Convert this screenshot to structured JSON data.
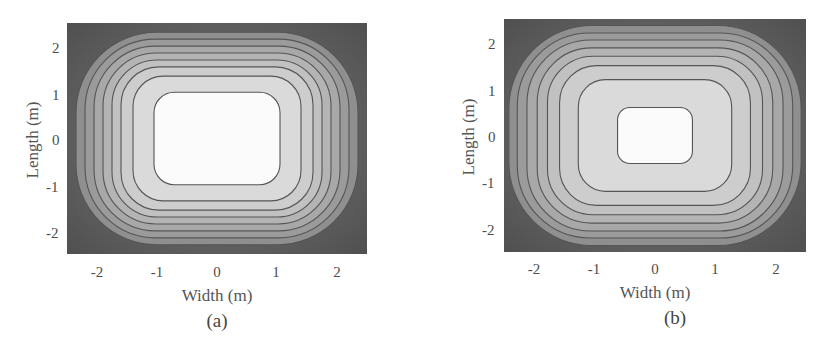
{
  "figure": {
    "panels": [
      {
        "id": "a",
        "caption": "(a)",
        "xlabel": "Width (m)",
        "ylabel": "Length (m)",
        "xticks": [
          "-2",
          "-1",
          "0",
          "1",
          "2"
        ],
        "yticks": [
          "2",
          "1",
          "0",
          "-1",
          "-2"
        ]
      },
      {
        "id": "b",
        "caption": "(b)",
        "xlabel": "Width (m)",
        "ylabel": "Length (m)",
        "xticks": [
          "-2",
          "-1",
          "0",
          "1",
          "2"
        ],
        "yticks": [
          "2",
          "1",
          "0",
          "-1",
          "-2"
        ]
      }
    ]
  },
  "colors": {
    "center": "#fbfbfb",
    "edge": "#4f4f4f",
    "contour_line": "#555555"
  },
  "chart_data": [
    {
      "type": "heatmap",
      "subtype": "filled-contour",
      "title": "(a)",
      "xlabel": "Width (m)",
      "ylabel": "Length (m)",
      "xlim": [
        -2.5,
        2.5
      ],
      "ylim": [
        -2.5,
        2.5
      ],
      "xticks": [
        -2,
        -1,
        0,
        1,
        2
      ],
      "yticks": [
        -2,
        -1,
        0,
        1,
        2
      ],
      "colormap": "gray (light center, dark edges/corners)",
      "contour_levels": 8,
      "innermost_contour_extent": {
        "x": [
          -1.05,
          1.05
        ],
        "y": [
          -1.0,
          1.0
        ]
      },
      "contour_half_widths_x": [
        1.05,
        1.4,
        1.6,
        1.75,
        1.9,
        2.05,
        2.2,
        2.35
      ],
      "contour_half_heights_y": [
        1.0,
        1.35,
        1.55,
        1.7,
        1.85,
        2.0,
        2.15,
        2.3
      ],
      "grid": false,
      "legend": null
    },
    {
      "type": "heatmap",
      "subtype": "filled-contour",
      "title": "(b)",
      "xlabel": "Width (m)",
      "ylabel": "Length (m)",
      "xlim": [
        -2.5,
        2.5
      ],
      "ylim": [
        -2.5,
        2.5
      ],
      "xticks": [
        -2,
        -1,
        0,
        1,
        2
      ],
      "yticks": [
        -2,
        -1,
        0,
        1,
        2
      ],
      "colormap": "gray (light center, dark edges/corners)",
      "contour_levels": 8,
      "innermost_contour_extent": {
        "x": [
          -0.62,
          0.62
        ],
        "y": [
          -0.6,
          0.6
        ]
      },
      "contour_half_widths_x": [
        0.62,
        1.27,
        1.58,
        1.78,
        1.95,
        2.12,
        2.28,
        2.42
      ],
      "contour_half_heights_y": [
        0.6,
        1.2,
        1.5,
        1.7,
        1.88,
        2.05,
        2.2,
        2.36
      ],
      "grid": false,
      "legend": null
    }
  ]
}
